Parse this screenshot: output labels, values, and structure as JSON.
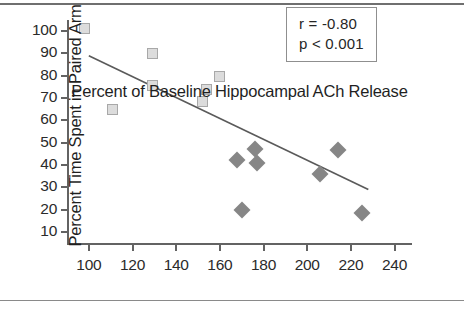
{
  "chart_data": {
    "type": "scatter",
    "title": "",
    "xlabel": "Percent of Baseline Hippocampal ACh Release",
    "ylabel": "Percent Time Spent in Paired Arm",
    "xlim": [
      90,
      248
    ],
    "ylim": [
      5,
      105
    ],
    "xticks": [
      100,
      120,
      140,
      160,
      180,
      200,
      220,
      240
    ],
    "yticks": [
      10,
      20,
      30,
      40,
      50,
      60,
      70,
      80,
      90,
      100
    ],
    "grid": false,
    "legend": "none",
    "annotations": [
      "r = -0.80",
      "p < 0.001"
    ],
    "series": [
      {
        "name": "open-squares",
        "marker": "square",
        "color": "#dcdcdc",
        "edgecolor": "#a8a8a8",
        "points": [
          {
            "x": 98,
            "y": 101
          },
          {
            "x": 111,
            "y": 65
          },
          {
            "x": 129,
            "y": 90
          },
          {
            "x": 129,
            "y": 75.5
          },
          {
            "x": 152,
            "y": 68.5
          },
          {
            "x": 154,
            "y": 74
          },
          {
            "x": 160,
            "y": 79.5
          }
        ]
      },
      {
        "name": "filled-diamonds",
        "marker": "diamond",
        "color": "#868686",
        "points": [
          {
            "x": 168,
            "y": 42
          },
          {
            "x": 170,
            "y": 20
          },
          {
            "x": 176,
            "y": 47
          },
          {
            "x": 177,
            "y": 41
          },
          {
            "x": 206,
            "y": 36
          },
          {
            "x": 214,
            "y": 46.5
          },
          {
            "x": 225,
            "y": 18.5
          }
        ]
      }
    ],
    "trend_line": {
      "x_start": 100,
      "y_start": 89,
      "x_end": 228,
      "y_end": 29,
      "color": "#5a5a5a"
    }
  },
  "stats": {
    "r_label": "r = -0.80",
    "p_label": "p < 0.001"
  },
  "axes": {
    "x_title": "Percent of Baseline Hippocampal ACh Release",
    "y_title": "Percent Time Spent in Paired Arm",
    "x_tick_labels": [
      "100",
      "120",
      "140",
      "160",
      "180",
      "200",
      "220",
      "240"
    ],
    "y_tick_labels": [
      "10",
      "20",
      "30",
      "40",
      "50",
      "60",
      "70",
      "80",
      "90",
      "100"
    ]
  }
}
